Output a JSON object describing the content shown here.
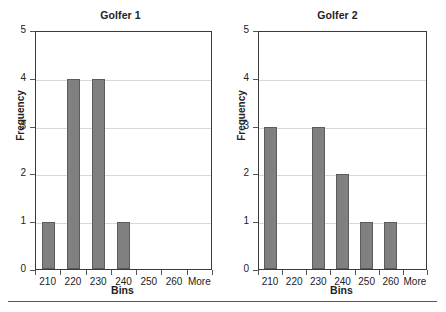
{
  "chart_data": [
    {
      "type": "bar",
      "title": "Golfer 1",
      "xlabel": "Bins",
      "ylabel": "Frequency",
      "categories": [
        "210",
        "220",
        "230",
        "240",
        "250",
        "260",
        "More"
      ],
      "values": [
        1,
        4,
        4,
        1,
        0,
        0,
        0
      ],
      "ylim": [
        0,
        5
      ],
      "yticks": [
        "0",
        "1",
        "2",
        "3",
        "4",
        "5"
      ],
      "grid": true,
      "legend": "none",
      "bar_color": "#808080",
      "bar_edge_color": "#5c5c5c"
    },
    {
      "type": "bar",
      "title": "Golfer 2",
      "xlabel": "Bins",
      "ylabel": "Frequency",
      "categories": [
        "210",
        "220",
        "230",
        "240",
        "250",
        "260",
        "More"
      ],
      "values": [
        3,
        0,
        3,
        2,
        1,
        1,
        0
      ],
      "ylim": [
        0,
        5
      ],
      "yticks": [
        "0",
        "1",
        "2",
        "3",
        "4",
        "5"
      ],
      "grid": true,
      "legend": "none",
      "bar_color": "#808080",
      "bar_edge_color": "#5c5c5c"
    }
  ]
}
